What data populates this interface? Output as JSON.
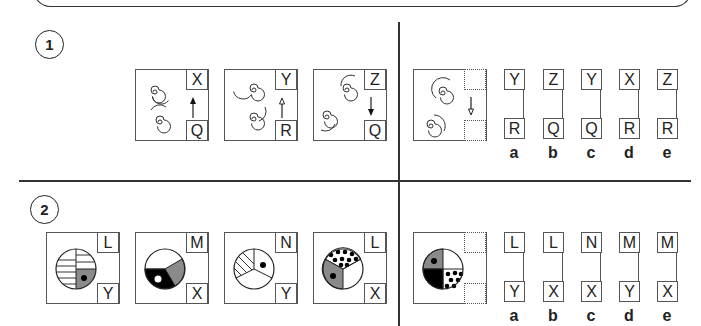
{
  "questions": [
    {
      "number": "1",
      "figures": [
        {
          "top": "X",
          "bottom": "Q",
          "arrow": "up-filled"
        },
        {
          "top": "Y",
          "bottom": "R",
          "arrow": "up-open"
        },
        {
          "top": "Z",
          "bottom": "Q",
          "arrow": "down-filled"
        }
      ],
      "question_figure": {
        "top": "",
        "bottom": "",
        "arrow": "down-open"
      },
      "options": [
        {
          "label": "a",
          "top": "Y",
          "bottom": "R"
        },
        {
          "label": "b",
          "top": "Z",
          "bottom": "Q"
        },
        {
          "label": "c",
          "top": "Y",
          "bottom": "Q"
        },
        {
          "label": "d",
          "top": "X",
          "bottom": "R"
        },
        {
          "label": "e",
          "top": "Z",
          "bottom": "R"
        }
      ]
    },
    {
      "number": "2",
      "figures": [
        {
          "top": "L",
          "bottom": "Y",
          "shape": "circle-halves-horizontal-lines-grey-quarter-dot"
        },
        {
          "top": "M",
          "bottom": "X",
          "shape": "circle-thirds-grey-black-white-dot"
        },
        {
          "top": "N",
          "bottom": "Y",
          "shape": "circle-thirds-hatched-dot"
        },
        {
          "top": "L",
          "bottom": "X",
          "shape": "circle-thirds-dotted-grey-dot"
        }
      ],
      "question_figure": {
        "top": "",
        "bottom": "",
        "shape": "circle-quarters-grey-dot-black-dotted"
      },
      "options": [
        {
          "label": "a",
          "top": "L",
          "bottom": "Y"
        },
        {
          "label": "b",
          "top": "L",
          "bottom": "X"
        },
        {
          "label": "c",
          "top": "N",
          "bottom": "X"
        },
        {
          "label": "d",
          "top": "M",
          "bottom": "Y"
        },
        {
          "label": "e",
          "top": "M",
          "bottom": "X"
        }
      ]
    }
  ],
  "colors": {
    "grey": "#8a8a8a",
    "line": "#333333",
    "black": "#000000"
  }
}
